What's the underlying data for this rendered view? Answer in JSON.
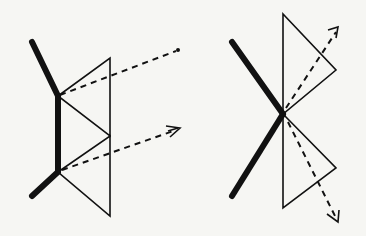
{
  "diagram": {
    "type": "optical-ray-diagram",
    "colors": {
      "ink": "#111111",
      "paper": "#f6f6f3"
    },
    "left_figure": {
      "thick_mirror": [
        [
          32,
          42
        ],
        [
          58,
          96
        ],
        [
          58,
          172
        ],
        [
          32,
          196
        ]
      ],
      "triangles": [
        [
          [
            58,
            96
          ],
          [
            110,
            58
          ],
          [
            110,
            136
          ]
        ],
        [
          [
            58,
            172
          ],
          [
            110,
            136
          ],
          [
            110,
            216
          ]
        ]
      ],
      "rays": [
        {
          "from": [
            58,
            96
          ],
          "to": [
            178,
            50
          ],
          "ending": "dot"
        },
        {
          "from": [
            58,
            172
          ],
          "to": [
            180,
            128
          ],
          "ending": "arrowhead"
        }
      ]
    },
    "right_figure": {
      "thick_mirror": [
        [
          232,
          42
        ],
        [
          283,
          114
        ],
        [
          232,
          196
        ]
      ],
      "triangles": [
        [
          [
            283,
            114
          ],
          [
            283,
            14
          ],
          [
            336,
            70
          ]
        ],
        [
          [
            283,
            114
          ],
          [
            336,
            168
          ],
          [
            283,
            208
          ]
        ]
      ],
      "rays": [
        {
          "from": [
            283,
            114
          ],
          "to": [
            338,
            28
          ],
          "ending": "arrowhead"
        },
        {
          "from": [
            283,
            114
          ],
          "to": [
            338,
            222
          ],
          "ending": "arrowhead"
        }
      ]
    }
  }
}
